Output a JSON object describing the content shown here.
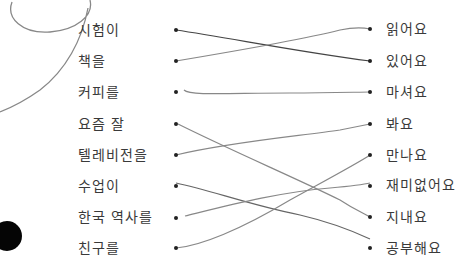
{
  "worksheet": {
    "left_items": [
      {
        "text": "시험이",
        "y": 30
      },
      {
        "text": "책을",
        "y": 61
      },
      {
        "text": "커피를",
        "y": 92
      },
      {
        "text": "요즘 잘",
        "y": 124
      },
      {
        "text": "텔레비전을",
        "y": 155
      },
      {
        "text": "수업이",
        "y": 186
      },
      {
        "text": "한국 역사를",
        "y": 217
      },
      {
        "text": "친구를",
        "y": 248
      }
    ],
    "right_items": [
      {
        "text": "읽어요",
        "y": 29
      },
      {
        "text": "있어요",
        "y": 61
      },
      {
        "text": "마셔요",
        "y": 92
      },
      {
        "text": "봐요",
        "y": 124
      },
      {
        "text": "만나요",
        "y": 155
      },
      {
        "text": "재미없어요",
        "y": 185
      },
      {
        "text": "지내요",
        "y": 217
      },
      {
        "text": "공부해요",
        "y": 248
      }
    ],
    "matches": [
      {
        "left": "시험이",
        "right": "있어요"
      },
      {
        "left": "책을",
        "right": "읽어요"
      },
      {
        "left": "커피를",
        "right": "마셔요"
      },
      {
        "left": "요즘 잘",
        "right": "지내요"
      },
      {
        "left": "텔레비전을",
        "right": "봐요"
      },
      {
        "left": "수업이",
        "right": "공부해요"
      },
      {
        "left": "한국 역사를",
        "right": "재미없어요"
      },
      {
        "left": "친구를",
        "right": "만나요"
      }
    ],
    "colors": {
      "ink": "#3a3a3a",
      "pencil": "#7a7a7a",
      "pen": "#444444"
    }
  }
}
